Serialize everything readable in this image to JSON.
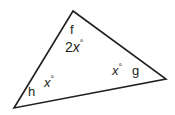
{
  "figure": {
    "kind": "triangle-diagram",
    "background_color": "#ffffff",
    "stroke_color": "#231f20",
    "stroke_width": 1.6,
    "text_color": "#231f20",
    "canvas": {
      "width": 175,
      "height": 115
    },
    "vertices": [
      {
        "id": "top",
        "label": "f",
        "x": 73,
        "y": 11
      },
      {
        "id": "bottom-left",
        "label": "h",
        "x": 14,
        "y": 108
      },
      {
        "id": "right",
        "label": "g",
        "x": 166,
        "y": 79
      }
    ],
    "polygon_points": "73,11 166,79 14,108",
    "angles": [
      {
        "at_vertex": "top",
        "coefficient": "2",
        "variable": "x",
        "degree_symbol": "°",
        "text": "2x°"
      },
      {
        "at_vertex": "bottom-left",
        "coefficient": "",
        "variable": "x",
        "degree_symbol": "°",
        "text": "x°"
      },
      {
        "at_vertex": "right",
        "coefficient": "",
        "variable": "x",
        "degree_symbol": "°",
        "text": "x°"
      }
    ],
    "labels": {
      "vertex_f": "f",
      "vertex_g": "g",
      "vertex_h": "h",
      "angle_top_coef": "2",
      "angle_top_var": "x",
      "angle_top_deg": "°",
      "angle_left_var": "x",
      "angle_left_deg": "°",
      "angle_right_var": "x",
      "angle_right_deg": "°"
    }
  }
}
